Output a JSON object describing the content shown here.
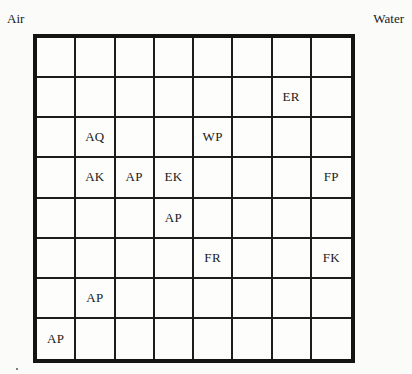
{
  "labels": {
    "top_left": "Air",
    "top_right": "Water"
  },
  "grid": {
    "rows": 8,
    "cols": 8,
    "cells": [
      [
        "",
        "",
        "",
        "",
        "",
        "",
        "",
        ""
      ],
      [
        "",
        "",
        "",
        "",
        "",
        "",
        "ER",
        ""
      ],
      [
        "",
        "AQ",
        "",
        "",
        "WP",
        "",
        "",
        ""
      ],
      [
        "",
        "AK",
        "AP",
        "EK",
        "",
        "",
        "",
        "FP"
      ],
      [
        "",
        "",
        "",
        "AP",
        "",
        "",
        "",
        ""
      ],
      [
        "",
        "",
        "",
        "",
        "FR",
        "",
        "",
        "FK"
      ],
      [
        "",
        "AP",
        "",
        "",
        "",
        "",
        "",
        ""
      ],
      [
        "AP",
        "",
        "",
        "",
        "",
        "",
        "",
        ""
      ]
    ]
  }
}
